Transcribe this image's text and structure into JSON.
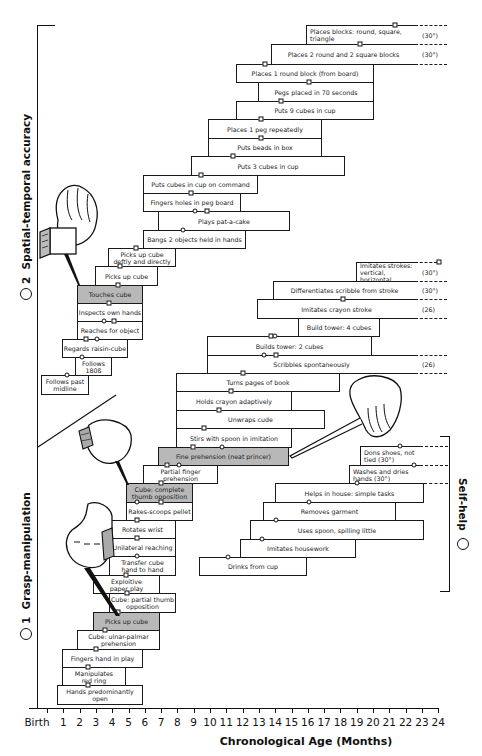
{
  "chart_data": {
    "type": "gantt-milestone",
    "title": "",
    "xlabel": "Chronological Age (Months)",
    "x_ticks": [
      "Birth",
      "1",
      "2",
      "3",
      "4",
      "5",
      "6",
      "7",
      "8",
      "9",
      "10",
      "11",
      "12",
      "13",
      "14",
      "15",
      "16",
      "17",
      "18",
      "19",
      "20",
      "21",
      "22",
      "23",
      "24"
    ],
    "xlim": [
      0,
      24
    ],
    "groups": [
      {
        "id": "1",
        "name": "Grasp-manipulation"
      },
      {
        "id": "2",
        "name": "Spatial-temporal accuracy"
      },
      {
        "id": "3",
        "name": "Self-help"
      }
    ],
    "marker_legend": {
      "square": "milestone (square marker)",
      "circle": "milestone (circle marker)"
    }
  },
  "axis": {
    "origin_px": 47,
    "px_per_month": 16.3,
    "ticks": [
      "Birth",
      "1",
      "2",
      "3",
      "4",
      "5",
      "6",
      "7",
      "8",
      "9",
      "10",
      "11",
      "12",
      "13",
      "14",
      "15",
      "16",
      "17",
      "18",
      "19",
      "20",
      "21",
      "22",
      "23",
      "24"
    ],
    "label": "Chronological Age (Months)"
  },
  "side_labels": {
    "spatial": {
      "num": "2",
      "text": "Spatial-temporal accuracy"
    },
    "grasp": {
      "num": "1",
      "text": "Grasp-manipulation"
    },
    "selfhelp": {
      "num": "3",
      "text": "Self-help"
    }
  },
  "bars": [
    {
      "label": "Places blocks: round, square, triangle",
      "x1": 306,
      "x2": 415,
      "y": 25,
      "h": 19,
      "dash": true,
      "note": "(30°)",
      "markers": [
        {
          "t": "s",
          "x": 395
        }
      ],
      "align": "left"
    },
    {
      "label": "Places 2 round and 2 square blocks",
      "x1": 271,
      "x2": 415,
      "y": 44,
      "h": 20,
      "dash": true,
      "note": "(30°)",
      "markers": [
        {
          "t": "s",
          "x": 360
        }
      ]
    },
    {
      "label": "Places 1 round block (from board)",
      "x1": 236,
      "x2": 374,
      "y": 64,
      "h": 18,
      "markers": [
        {
          "t": "s",
          "x": 265
        }
      ]
    },
    {
      "label": "Pegs placed in 70 seconds",
      "x1": 258,
      "x2": 374,
      "y": 82,
      "h": 19,
      "markers": [
        {
          "t": "s",
          "x": 309
        }
      ]
    },
    {
      "label": "Puts 9 cubes in cup",
      "x1": 236,
      "x2": 374,
      "y": 101,
      "h": 18,
      "markers": [
        {
          "t": "s",
          "x": 281
        }
      ]
    },
    {
      "label": "Places 1 peg repeatedly",
      "x1": 208,
      "x2": 322,
      "y": 119,
      "h": 19,
      "markers": [
        {
          "t": "s",
          "x": 261
        }
      ]
    },
    {
      "label": "Puts beads in box",
      "x1": 208,
      "x2": 322,
      "y": 138,
      "h": 18,
      "markers": [
        {
          "t": "s",
          "x": 261
        }
      ]
    },
    {
      "label": "Puts 3 cubes in cup",
      "x1": 191,
      "x2": 345,
      "y": 156,
      "h": 19,
      "markers": [
        {
          "t": "s",
          "x": 233
        }
      ]
    },
    {
      "label": "Puts cubes in cup on command",
      "x1": 143,
      "x2": 258,
      "y": 175,
      "h": 18,
      "markers": [
        {
          "t": "s",
          "x": 201
        }
      ]
    },
    {
      "label": "Fingers holes in peg board",
      "x1": 143,
      "x2": 241,
      "y": 193,
      "h": 18,
      "markers": [
        {
          "t": "s",
          "x": 191
        }
      ]
    },
    {
      "label": "Plays pat-a-cake",
      "x1": 158,
      "x2": 290,
      "y": 211,
      "h": 19,
      "markers": [
        {
          "t": "c",
          "x": 195
        },
        {
          "t": "s",
          "x": 207
        }
      ]
    },
    {
      "label": "Bangs 2 objects held in hands",
      "x1": 143,
      "x2": 246,
      "y": 230,
      "h": 18,
      "markers": [
        {
          "t": "c",
          "x": 183
        }
      ]
    },
    {
      "label": "Picks up cube\ndeftly and directly",
      "x1": 108,
      "x2": 176,
      "y": 248,
      "h": 18,
      "markers": [
        {
          "t": "s",
          "x": 136
        }
      ]
    },
    {
      "label": "Picks up cube",
      "x1": 95,
      "x2": 158,
      "y": 266,
      "h": 19,
      "markers": [
        {
          "t": "s",
          "x": 120
        }
      ]
    },
    {
      "label": "Touches cube",
      "x1": 77,
      "x2": 143,
      "y": 285,
      "h": 18,
      "gray": true,
      "markers": [
        {
          "t": "s",
          "x": 118
        }
      ]
    },
    {
      "label": "Inspects own hands",
      "x1": 77,
      "x2": 143,
      "y": 303,
      "h": 18,
      "markers": [
        {
          "t": "s",
          "x": 109
        }
      ]
    },
    {
      "label": "Reaches for object",
      "x1": 77,
      "x2": 143,
      "y": 321,
      "h": 18,
      "markers": [
        {
          "t": "c",
          "x": 104
        },
        {
          "t": "s",
          "x": 114
        }
      ]
    },
    {
      "label": "Regards raisin-cube",
      "x1": 62,
      "x2": 128,
      "y": 339,
      "h": 18,
      "markers": [
        {
          "t": "s",
          "x": 86
        },
        {
          "t": "c",
          "x": 97
        }
      ]
    },
    {
      "label": "Follows\n180ß",
      "x1": 75,
      "x2": 112,
      "y": 357,
      "h": 18,
      "markers": [
        {
          "t": "c",
          "x": 82
        }
      ]
    },
    {
      "label": "Follows past\nmidline",
      "x1": 41,
      "x2": 89,
      "y": 375,
      "h": 19,
      "markers": [
        {
          "t": "c",
          "x": 67
        }
      ]
    },
    {
      "label": "Imitates strokes:\nvertical, horizontal",
      "x1": 356,
      "x2": 415,
      "y": 262,
      "h": 19,
      "dash": true,
      "note": "(30°)",
      "markers": [
        {
          "t": "s",
          "x": 439
        }
      ],
      "align": "left"
    },
    {
      "label": "Differentiates scribble from stroke",
      "x1": 273,
      "x2": 415,
      "y": 281,
      "h": 18,
      "dash": true,
      "note": "(30°)",
      "markers": []
    },
    {
      "label": "Imitates crayon stroke",
      "x1": 257,
      "x2": 415,
      "y": 299,
      "h": 19,
      "dash": true,
      "note": "(26)",
      "markers": [
        {
          "t": "s",
          "x": 343
        }
      ]
    },
    {
      "label": "Build tower: 4 cubes",
      "x1": 298,
      "x2": 380,
      "y": 318,
      "h": 18,
      "markers": []
    },
    {
      "label": "Builds tower: 2 cubes",
      "x1": 207,
      "x2": 372,
      "y": 336,
      "h": 19,
      "markers": [
        {
          "t": "s",
          "x": 271
        },
        {
          "t": "c",
          "x": 275
        }
      ]
    },
    {
      "label": "Scribbles spontaneously",
      "x1": 207,
      "x2": 415,
      "y": 355,
      "h": 18,
      "dash": true,
      "note": "(26)",
      "markers": [
        {
          "t": "c",
          "x": 264
        },
        {
          "t": "s",
          "x": 276
        }
      ]
    },
    {
      "label": "Turns pages of book",
      "x1": 176,
      "x2": 340,
      "y": 373,
      "h": 18,
      "markers": [
        {
          "t": "s",
          "x": 243
        }
      ]
    },
    {
      "label": "Holds crayon adaptively",
      "x1": 176,
      "x2": 292,
      "y": 391,
      "h": 19,
      "markers": [
        {
          "t": "s",
          "x": 231
        }
      ]
    },
    {
      "label": "Unwraps cude",
      "x1": 176,
      "x2": 325,
      "y": 410,
      "h": 18,
      "markers": [
        {
          "t": "s",
          "x": 219
        }
      ]
    },
    {
      "label": "Stirs with spoon in imitation",
      "x1": 176,
      "x2": 292,
      "y": 428,
      "h": 19,
      "markers": [
        {
          "t": "s",
          "x": 204
        }
      ]
    },
    {
      "label": "Fine prehension (neat princer)",
      "x1": 158,
      "x2": 289,
      "y": 447,
      "h": 18,
      "gray": true,
      "markers": [
        {
          "t": "s",
          "x": 193
        },
        {
          "t": "c",
          "x": 222
        }
      ]
    },
    {
      "label": "Partial finger prehension",
      "x1": 143,
      "x2": 218,
      "y": 465,
      "h": 18,
      "markers": [
        {
          "t": "s",
          "x": 167
        },
        {
          "t": "c",
          "x": 179
        }
      ]
    },
    {
      "label": "Cube: complete\nthumb opposition",
      "x1": 126,
      "x2": 193,
      "y": 483,
      "h": 19,
      "gray": true,
      "markers": [
        {
          "t": "s",
          "x": 161
        }
      ]
    },
    {
      "label": "Rakes-scoops pellet",
      "x1": 126,
      "x2": 193,
      "y": 502,
      "h": 18,
      "markers": [
        {
          "t": "c",
          "x": 137
        },
        {
          "t": "s",
          "x": 161
        }
      ]
    },
    {
      "label": "Rotates wrist",
      "x1": 109,
      "x2": 176,
      "y": 520,
      "h": 18,
      "markers": [
        {
          "t": "s",
          "x": 137
        }
      ]
    },
    {
      "label": "Unilateral reaching",
      "x1": 109,
      "x2": 176,
      "y": 538,
      "h": 18,
      "markers": [
        {
          "t": "s",
          "x": 137
        }
      ]
    },
    {
      "label": "Transfer cube\nhand to hand",
      "x1": 109,
      "x2": 176,
      "y": 556,
      "h": 19,
      "markers": [
        {
          "t": "c",
          "x": 137
        }
      ]
    },
    {
      "label": "Exploitive\npaper play",
      "x1": 93,
      "x2": 160,
      "y": 575,
      "h": 18,
      "markers": [
        {
          "t": "s",
          "x": 126
        }
      ]
    },
    {
      "label": "Cube: partial thumb\nopposition",
      "x1": 109,
      "x2": 176,
      "y": 593,
      "h": 19,
      "markers": [
        {
          "t": "s",
          "x": 127
        }
      ]
    },
    {
      "label": "Picks up cube",
      "x1": 93,
      "x2": 160,
      "y": 612,
      "h": 18,
      "gray": true,
      "markers": [
        {
          "t": "s",
          "x": 118
        }
      ]
    },
    {
      "label": "Cube: ulnar-palmar\nprehension",
      "x1": 77,
      "x2": 160,
      "y": 630,
      "h": 19,
      "markers": [
        {
          "t": "s",
          "x": 105
        }
      ]
    },
    {
      "label": "Fingers hand in play",
      "x1": 62,
      "x2": 143,
      "y": 649,
      "h": 18,
      "markers": [
        {
          "t": "s",
          "x": 96
        }
      ]
    },
    {
      "label": "Manipulates\nred ring",
      "x1": 62,
      "x2": 126,
      "y": 667,
      "h": 18,
      "markers": [
        {
          "t": "s",
          "x": 88
        }
      ]
    },
    {
      "label": "Hands predominantly open",
      "x1": 57,
      "x2": 143,
      "y": 685,
      "h": 19,
      "markers": [
        {
          "t": "s",
          "x": 88
        }
      ]
    },
    {
      "label": "Dons shoes, not tied (30°)",
      "x1": 360,
      "x2": 420,
      "y": 446,
      "h": 19,
      "dash": true,
      "markers": [
        {
          "t": "c",
          "x": 400
        }
      ],
      "align": "left"
    },
    {
      "label": "Washes and dries hands (30°)",
      "x1": 349,
      "x2": 420,
      "y": 465,
      "h": 18,
      "dash": true,
      "markers": [
        {
          "t": "c",
          "x": 414
        }
      ],
      "align": "left"
    },
    {
      "label": "Helps in house: simple tasks",
      "x1": 275,
      "x2": 424,
      "y": 483,
      "h": 19,
      "markers": [
        {
          "t": "c",
          "x": 357
        }
      ]
    },
    {
      "label": "Removes garment",
      "x1": 263,
      "x2": 396,
      "y": 502,
      "h": 18,
      "markers": [
        {
          "t": "c",
          "x": 309
        }
      ]
    },
    {
      "label": "Uses spoon, spilling little",
      "x1": 250,
      "x2": 424,
      "y": 520,
      "h": 19,
      "markers": [
        {
          "t": "c",
          "x": 276
        }
      ]
    },
    {
      "label": "Imitates housework",
      "x1": 240,
      "x2": 356,
      "y": 539,
      "h": 18,
      "markers": [
        {
          "t": "c",
          "x": 262
        }
      ]
    },
    {
      "label": "Drinks from cup",
      "x1": 199,
      "x2": 307,
      "y": 557,
      "h": 18,
      "markers": [
        {
          "t": "c",
          "x": 228
        }
      ]
    }
  ],
  "dashes": [
    {
      "x1": 415,
      "x2": 447,
      "y": 25
    },
    {
      "x1": 415,
      "x2": 447,
      "y": 44
    },
    {
      "x1": 415,
      "x2": 447,
      "y": 64
    },
    {
      "x1": 415,
      "x2": 437,
      "y": 262
    },
    {
      "x1": 415,
      "x2": 447,
      "y": 281
    },
    {
      "x1": 415,
      "x2": 447,
      "y": 299
    },
    {
      "x1": 415,
      "x2": 447,
      "y": 318
    },
    {
      "x1": 415,
      "x2": 447,
      "y": 355
    },
    {
      "x1": 415,
      "x2": 447,
      "y": 373
    },
    {
      "x1": 420,
      "x2": 448,
      "y": 446
    },
    {
      "x1": 420,
      "x2": 448,
      "y": 465
    },
    {
      "x1": 424,
      "x2": 448,
      "y": 483
    }
  ]
}
